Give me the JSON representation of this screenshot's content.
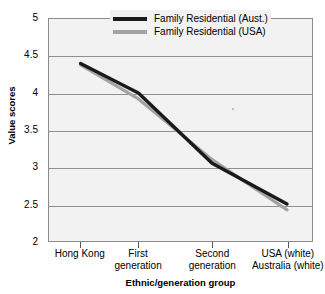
{
  "chart_data": {
    "type": "line",
    "title": "",
    "xlabel": "Ethnic/generation group",
    "ylabel": "Value scores",
    "categories": [
      "Hong Kong",
      "First\ngeneration",
      "Second\ngeneration",
      "USA (white)\nAustralia (white)"
    ],
    "series": [
      {
        "name": "Family Residential (Aust.)",
        "color": "#1a1a1a",
        "values": [
          4.4,
          4.0,
          3.05,
          2.5
        ]
      },
      {
        "name": "Family Residential (USA)",
        "color": "#a3a3a3",
        "values": [
          4.38,
          3.92,
          3.1,
          2.42
        ]
      }
    ],
    "ylim": [
      2,
      5
    ],
    "ytick_values": [
      5,
      4.5,
      4,
      3.5,
      3,
      2.5,
      2
    ],
    "ytick_labels": [
      "5",
      "4.5",
      "4",
      "3.5",
      "3",
      "2.5",
      "2"
    ],
    "grid": true,
    "legend_position": "top-right-inside",
    "plot_background": "#f2f2f2",
    "gridline_color": "#8f8f8f",
    "axis_color": "#8c8c8c"
  },
  "legend": {
    "entries": [
      {
        "label": "Family Residential (Aust.)",
        "color": "#1a1a1a"
      },
      {
        "label": "Family Residential (USA)",
        "color": "#a3a3a3"
      }
    ]
  },
  "axes": {
    "y_title": "Value scores",
    "x_title": "Ethnic/generation group",
    "y_ticks": [
      "5",
      "4.5",
      "4",
      "3.5",
      "3",
      "2.5",
      "2"
    ],
    "x_ticks": [
      "Hong Kong",
      "First\ngeneration",
      "Second\ngeneration",
      "USA (white)\nAustralia (white)"
    ]
  }
}
